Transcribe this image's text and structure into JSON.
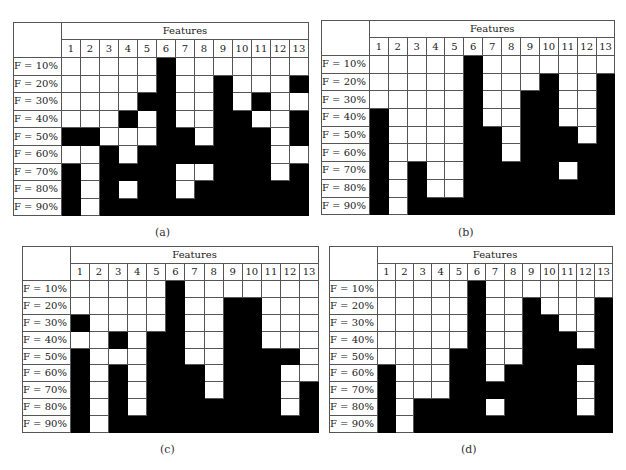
{
  "chart_data": [
    {
      "type": "heatmap",
      "panel_label": "(a)",
      "column_header": "Features",
      "columns": [
        "1",
        "2",
        "3",
        "4",
        "5",
        "6",
        "7",
        "8",
        "9",
        "10",
        "11",
        "12",
        "13"
      ],
      "rows": [
        "F = 10%",
        "F = 20%",
        "F = 30%",
        "F = 40%",
        "F = 50%",
        "F = 60%",
        "F = 70%",
        "F = 80%",
        "F = 90%"
      ],
      "legend": {
        "1": "black (feature selected)",
        "0": "white (not selected)"
      },
      "matrix": [
        [
          0,
          0,
          0,
          0,
          0,
          1,
          0,
          0,
          0,
          0,
          0,
          0,
          0
        ],
        [
          0,
          0,
          0,
          0,
          0,
          1,
          0,
          0,
          1,
          0,
          0,
          0,
          1
        ],
        [
          0,
          0,
          0,
          0,
          1,
          1,
          0,
          0,
          1,
          0,
          1,
          0,
          0
        ],
        [
          0,
          0,
          0,
          1,
          0,
          1,
          0,
          0,
          1,
          1,
          0,
          0,
          1
        ],
        [
          1,
          1,
          0,
          0,
          0,
          1,
          1,
          0,
          1,
          1,
          1,
          0,
          1
        ],
        [
          0,
          0,
          1,
          0,
          1,
          1,
          1,
          1,
          1,
          1,
          1,
          0,
          0
        ],
        [
          1,
          0,
          1,
          1,
          1,
          1,
          0,
          0,
          1,
          1,
          1,
          0,
          1
        ],
        [
          1,
          0,
          1,
          0,
          1,
          1,
          0,
          1,
          1,
          1,
          1,
          1,
          1
        ],
        [
          1,
          0,
          1,
          1,
          1,
          1,
          1,
          1,
          1,
          1,
          1,
          1,
          1
        ]
      ]
    },
    {
      "type": "heatmap",
      "panel_label": "(b)",
      "column_header": "Features",
      "columns": [
        "1",
        "2",
        "3",
        "4",
        "5",
        "6",
        "7",
        "8",
        "9",
        "10",
        "11",
        "12",
        "13"
      ],
      "rows": [
        "F = 10%",
        "F = 20%",
        "F = 30%",
        "F = 40%",
        "F = 50%",
        "F = 60%",
        "F = 70%",
        "F = 80%",
        "F = 90%"
      ],
      "legend": {
        "1": "black (feature selected)",
        "0": "white (not selected)"
      },
      "matrix": [
        [
          0,
          0,
          0,
          0,
          0,
          1,
          0,
          0,
          0,
          0,
          0,
          0,
          0
        ],
        [
          0,
          0,
          0,
          0,
          0,
          1,
          0,
          0,
          0,
          1,
          0,
          0,
          1
        ],
        [
          0,
          0,
          0,
          0,
          0,
          1,
          0,
          0,
          1,
          1,
          0,
          0,
          1
        ],
        [
          1,
          0,
          0,
          0,
          0,
          1,
          0,
          0,
          1,
          1,
          0,
          0,
          1
        ],
        [
          1,
          0,
          0,
          0,
          0,
          1,
          1,
          0,
          1,
          1,
          1,
          0,
          1
        ],
        [
          1,
          0,
          0,
          0,
          0,
          1,
          1,
          0,
          1,
          1,
          1,
          1,
          1
        ],
        [
          1,
          0,
          1,
          0,
          0,
          1,
          1,
          1,
          1,
          1,
          0,
          1,
          1
        ],
        [
          1,
          0,
          1,
          0,
          0,
          1,
          1,
          1,
          1,
          1,
          1,
          1,
          1
        ],
        [
          1,
          0,
          1,
          1,
          1,
          1,
          1,
          1,
          1,
          1,
          1,
          1,
          1
        ]
      ]
    },
    {
      "type": "heatmap",
      "panel_label": "(c)",
      "column_header": "Features",
      "columns": [
        "1",
        "2",
        "3",
        "4",
        "5",
        "6",
        "7",
        "8",
        "9",
        "10",
        "11",
        "12",
        "13"
      ],
      "rows": [
        "F = 10%",
        "F = 20%",
        "F = 30%",
        "F = 40%",
        "F = 50%",
        "F = 60%",
        "F = 70%",
        "F = 80%",
        "F = 90%"
      ],
      "legend": {
        "1": "black (feature selected)",
        "0": "white (not selected)"
      },
      "matrix": [
        [
          0,
          0,
          0,
          0,
          0,
          1,
          0,
          0,
          0,
          0,
          0,
          0,
          0
        ],
        [
          0,
          0,
          0,
          0,
          0,
          1,
          0,
          0,
          1,
          1,
          0,
          0,
          0
        ],
        [
          1,
          0,
          0,
          0,
          0,
          1,
          0,
          0,
          1,
          1,
          0,
          0,
          0
        ],
        [
          0,
          0,
          1,
          0,
          1,
          1,
          0,
          0,
          1,
          1,
          0,
          0,
          0
        ],
        [
          1,
          0,
          0,
          0,
          1,
          1,
          0,
          0,
          1,
          1,
          1,
          1,
          0
        ],
        [
          1,
          0,
          1,
          0,
          1,
          1,
          1,
          0,
          1,
          1,
          1,
          0,
          0
        ],
        [
          1,
          0,
          1,
          0,
          1,
          1,
          1,
          0,
          1,
          1,
          1,
          0,
          1
        ],
        [
          1,
          0,
          1,
          0,
          1,
          1,
          1,
          1,
          1,
          1,
          1,
          0,
          1
        ],
        [
          1,
          0,
          1,
          1,
          1,
          1,
          1,
          1,
          1,
          1,
          1,
          1,
          1
        ]
      ]
    },
    {
      "type": "heatmap",
      "panel_label": "(d)",
      "column_header": "Features",
      "columns": [
        "1",
        "2",
        "3",
        "4",
        "5",
        "6",
        "7",
        "8",
        "9",
        "10",
        "11",
        "12",
        "13"
      ],
      "rows": [
        "F = 10%",
        "F = 20%",
        "F = 30%",
        "F = 40%",
        "F = 50%",
        "F = 60%",
        "F = 70%",
        "F = 80%",
        "F = 90%"
      ],
      "legend": {
        "1": "black (feature selected)",
        "0": "white (not selected)"
      },
      "matrix": [
        [
          0,
          0,
          0,
          0,
          0,
          1,
          0,
          0,
          0,
          0,
          0,
          0,
          0
        ],
        [
          0,
          0,
          0,
          0,
          0,
          1,
          0,
          0,
          1,
          0,
          0,
          0,
          1
        ],
        [
          0,
          0,
          0,
          0,
          0,
          1,
          0,
          0,
          1,
          1,
          0,
          0,
          1
        ],
        [
          0,
          0,
          0,
          0,
          0,
          1,
          0,
          0,
          1,
          1,
          1,
          0,
          1
        ],
        [
          0,
          0,
          0,
          0,
          1,
          1,
          0,
          0,
          1,
          1,
          1,
          1,
          1
        ],
        [
          1,
          0,
          0,
          0,
          1,
          1,
          0,
          1,
          1,
          1,
          1,
          0,
          1
        ],
        [
          1,
          0,
          0,
          0,
          1,
          1,
          1,
          1,
          1,
          1,
          1,
          0,
          1
        ],
        [
          1,
          0,
          1,
          1,
          1,
          1,
          0,
          1,
          1,
          1,
          1,
          0,
          1
        ],
        [
          1,
          0,
          1,
          1,
          1,
          1,
          1,
          1,
          1,
          1,
          1,
          1,
          1
        ]
      ]
    }
  ],
  "layout": {
    "panels": [
      {
        "left": 13,
        "top": 22,
        "label_w": 47,
        "cell_w": 19.0,
        "head1_h": 17,
        "head2_h": 18,
        "row_h": 17.6,
        "caption_x": 155,
        "caption_y": 226
      },
      {
        "left": 321,
        "top": 20,
        "label_w": 46,
        "cell_w": 18.9,
        "head1_h": 17,
        "head2_h": 18,
        "row_h": 17.7,
        "caption_x": 458,
        "caption_y": 226
      },
      {
        "left": 22,
        "top": 246,
        "label_w": 45,
        "cell_w": 19.1,
        "head1_h": 17,
        "head2_h": 17,
        "row_h": 16.9,
        "caption_x": 160,
        "caption_y": 443
      },
      {
        "left": 329,
        "top": 246,
        "label_w": 42,
        "cell_w": 18.1,
        "head1_h": 17,
        "head2_h": 17,
        "row_h": 16.9,
        "caption_x": 461,
        "caption_y": 443
      }
    ]
  }
}
